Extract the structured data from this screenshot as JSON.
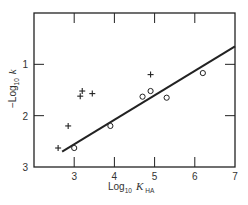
{
  "chart_data": {
    "type": "scatter",
    "title": "",
    "xlabel": "Log10 K_HA",
    "ylabel": "-Log10 k",
    "xlim": [
      2,
      7
    ],
    "ylim": [
      3,
      0
    ],
    "y_inverted": true,
    "grid": false,
    "legend": null,
    "x_ticks": [
      3,
      4,
      5,
      6,
      7
    ],
    "y_ticks": [
      1,
      2,
      3
    ],
    "series": [
      {
        "name": "plus",
        "marker": "+",
        "points": [
          {
            "x": 2.6,
            "y": 2.63
          },
          {
            "x": 2.85,
            "y": 2.2
          },
          {
            "x": 3.15,
            "y": 1.62
          },
          {
            "x": 3.2,
            "y": 1.52
          },
          {
            "x": 3.45,
            "y": 1.57
          },
          {
            "x": 4.9,
            "y": 1.2
          }
        ]
      },
      {
        "name": "circle",
        "marker": "o",
        "points": [
          {
            "x": 3.0,
            "y": 2.63
          },
          {
            "x": 3.9,
            "y": 2.2
          },
          {
            "x": 4.7,
            "y": 1.63
          },
          {
            "x": 4.9,
            "y": 1.52
          },
          {
            "x": 5.3,
            "y": 1.65
          },
          {
            "x": 6.2,
            "y": 1.17
          }
        ]
      }
    ],
    "fit_line": {
      "x": [
        2.7,
        7.0
      ],
      "y": [
        2.7,
        0.65
      ]
    }
  },
  "axes": {
    "x_label_main": "Log",
    "x_label_sub": "10",
    "x_label_var": "K",
    "x_label_var_sub": "HA",
    "y_label_main": "−Log",
    "y_label_sub": "10",
    "y_label_var": "k",
    "x_tick_labels": [
      "3",
      "4",
      "5",
      "6",
      "7"
    ],
    "y_tick_labels": [
      "1",
      "2",
      "3"
    ]
  },
  "colors": {
    "ink": "#222222",
    "background": "#ffffff"
  }
}
